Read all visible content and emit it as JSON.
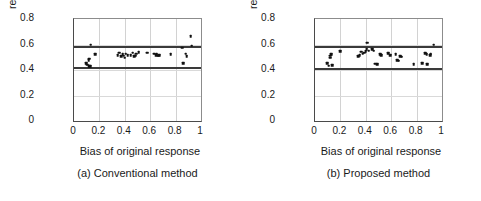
{
  "figure": {
    "axis": {
      "xlabel": "Bias of original response",
      "ylabel_line1": "Bias of resulting",
      "ylabel_line2": "response",
      "xticks": [
        "0",
        "0.2",
        "0.4",
        "0.6",
        "0.8",
        "1"
      ],
      "xtick_values": [
        0,
        0.2,
        0.4,
        0.6,
        0.8,
        1
      ],
      "yticks": [
        "0",
        "0.2",
        "0.4",
        "0.6",
        "0.8"
      ],
      "ytick_values": [
        0,
        0.2,
        0.4,
        0.6,
        0.8
      ]
    },
    "panels": [
      {
        "caption": "(a) Conventional method",
        "key": "a"
      },
      {
        "caption": "(b) Proposed method",
        "key": "b"
      }
    ]
  },
  "chart_data": [
    {
      "type": "scatter",
      "title": "(a) Conventional method",
      "xlabel": "Bias of original response",
      "ylabel": "Bias of resulting response",
      "xlim": [
        0,
        1
      ],
      "ylim": [
        0,
        0.8
      ],
      "grid": true,
      "reference_lines": [
        {
          "orientation": "horizontal",
          "y": 0.585
        },
        {
          "orientation": "horizontal",
          "y": 0.42
        }
      ],
      "points": [
        [
          0.095,
          0.455
        ],
        [
          0.105,
          0.44
        ],
        [
          0.115,
          0.475
        ],
        [
          0.118,
          0.49
        ],
        [
          0.122,
          0.432
        ],
        [
          0.128,
          0.428
        ],
        [
          0.132,
          0.597
        ],
        [
          0.168,
          0.525
        ],
        [
          0.345,
          0.517
        ],
        [
          0.358,
          0.536
        ],
        [
          0.372,
          0.508
        ],
        [
          0.382,
          0.522
        ],
        [
          0.392,
          0.512
        ],
        [
          0.398,
          0.496
        ],
        [
          0.408,
          0.527
        ],
        [
          0.422,
          0.515
        ],
        [
          0.448,
          0.518
        ],
        [
          0.462,
          0.535
        ],
        [
          0.472,
          0.508
        ],
        [
          0.482,
          0.512
        ],
        [
          0.492,
          0.527
        ],
        [
          0.508,
          0.538
        ],
        [
          0.578,
          0.535
        ],
        [
          0.632,
          0.528
        ],
        [
          0.645,
          0.518
        ],
        [
          0.652,
          0.528
        ],
        [
          0.662,
          0.512
        ],
        [
          0.672,
          0.516
        ],
        [
          0.762,
          0.522
        ],
        [
          0.852,
          0.575
        ],
        [
          0.858,
          0.452
        ],
        [
          0.878,
          0.527
        ],
        [
          0.888,
          0.508
        ],
        [
          0.918,
          0.665
        ],
        [
          0.928,
          0.592
        ]
      ]
    },
    {
      "type": "scatter",
      "title": "(b) Proposed method",
      "xlabel": "Bias of original response",
      "ylabel": "Bias of resulting response",
      "xlim": [
        0,
        1
      ],
      "ylim": [
        0,
        0.8
      ],
      "grid": true,
      "reference_lines": [
        {
          "orientation": "horizontal",
          "y": 0.585
        },
        {
          "orientation": "horizontal",
          "y": 0.415
        }
      ],
      "points": [
        [
          0.098,
          0.452
        ],
        [
          0.108,
          0.435
        ],
        [
          0.118,
          0.512
        ],
        [
          0.122,
          0.497
        ],
        [
          0.128,
          0.522
        ],
        [
          0.135,
          0.438
        ],
        [
          0.198,
          0.548
        ],
        [
          0.342,
          0.508
        ],
        [
          0.352,
          0.518
        ],
        [
          0.362,
          0.545
        ],
        [
          0.375,
          0.528
        ],
        [
          0.388,
          0.535
        ],
        [
          0.398,
          0.548
        ],
        [
          0.408,
          0.562
        ],
        [
          0.412,
          0.615
        ],
        [
          0.422,
          0.552
        ],
        [
          0.452,
          0.565
        ],
        [
          0.462,
          0.552
        ],
        [
          0.472,
          0.448
        ],
        [
          0.488,
          0.447
        ],
        [
          0.512,
          0.525
        ],
        [
          0.522,
          0.518
        ],
        [
          0.578,
          0.532
        ],
        [
          0.592,
          0.515
        ],
        [
          0.635,
          0.522
        ],
        [
          0.648,
          0.478
        ],
        [
          0.658,
          0.472
        ],
        [
          0.672,
          0.508
        ],
        [
          0.682,
          0.505
        ],
        [
          0.778,
          0.445
        ],
        [
          0.845,
          0.455
        ],
        [
          0.868,
          0.532
        ],
        [
          0.878,
          0.525
        ],
        [
          0.885,
          0.445
        ],
        [
          0.905,
          0.518
        ],
        [
          0.912,
          0.528
        ],
        [
          0.935,
          0.598
        ]
      ]
    }
  ]
}
